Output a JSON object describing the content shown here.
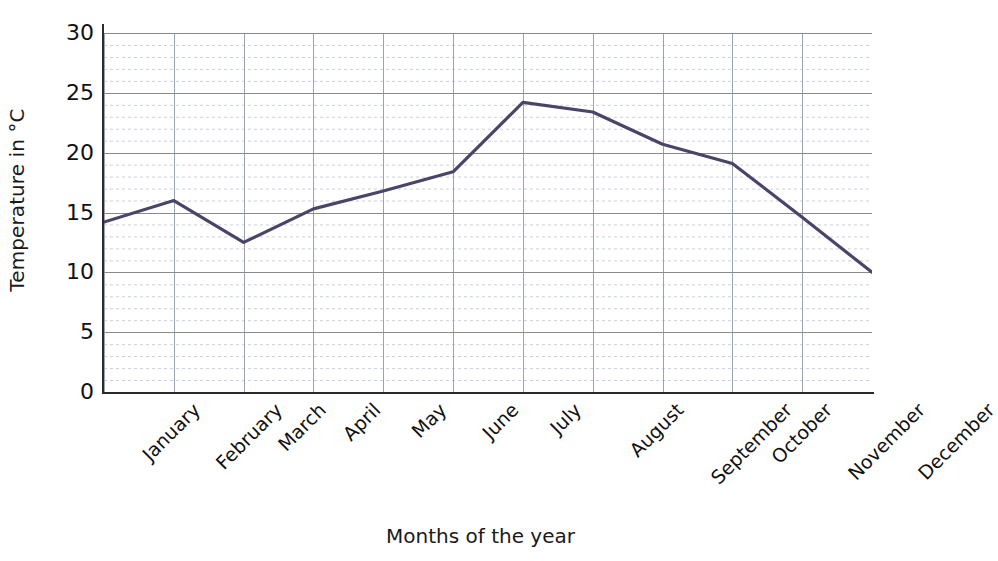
{
  "chart_data": {
    "type": "line",
    "title": "",
    "xlabel": "Months of the year",
    "ylabel": "Temperature in °C",
    "categories": [
      "January",
      "February",
      "March",
      "April",
      "May",
      "June",
      "July",
      "August",
      "September",
      "October",
      "November",
      "December"
    ],
    "values": [
      14.2,
      16.0,
      12.5,
      15.3,
      16.8,
      18.4,
      24.2,
      23.4,
      20.7,
      19.1,
      14.6,
      10.0
    ],
    "series": [
      {
        "name": "Temperature",
        "values": [
          14.2,
          16.0,
          12.5,
          15.3,
          16.8,
          18.4,
          24.2,
          23.4,
          20.7,
          19.1,
          14.6,
          10.0
        ],
        "color": "#4a4468"
      }
    ],
    "ylim": [
      0,
      30
    ],
    "y_ticks": [
      0,
      5,
      10,
      15,
      20,
      25,
      30
    ],
    "y_tick_labels": [
      "0",
      "5",
      "10",
      "15",
      "20",
      "25",
      "30"
    ],
    "y_minor_step": 1,
    "grid": {
      "major_horizontal": true,
      "minor_horizontal_dotted": true,
      "vertical": true,
      "major_color": "#8a8a8a",
      "minor_color": "#c8d0dc",
      "vertical_color": "#9aa3b0"
    },
    "legend": {
      "visible": false,
      "position": "none"
    },
    "markers": false,
    "line_width": 3.2
  },
  "axes": {
    "y_title": "Temperature in °C",
    "x_title": "Months of the year"
  },
  "colors": {
    "line": "#4a4468",
    "axis": "#2b2b2b",
    "text": "#111111",
    "background": "#ffffff"
  }
}
